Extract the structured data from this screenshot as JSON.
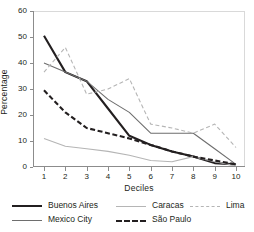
{
  "chart_data": {
    "type": "line",
    "title": "",
    "xlabel": "Deciles",
    "ylabel": "Percentage",
    "categories": [
      "1",
      "2",
      "3",
      "4",
      "5",
      "6",
      "7",
      "8",
      "9",
      "10"
    ],
    "x": [
      1,
      2,
      3,
      4,
      5,
      6,
      7,
      8,
      9,
      10
    ],
    "xlim": [
      1,
      10
    ],
    "ylim": [
      0,
      60
    ],
    "yticks": [
      0,
      10,
      20,
      30,
      40,
      50,
      60
    ],
    "grid": false,
    "legend_position": "bottom",
    "series": [
      {
        "name": "Buenos Aires",
        "color": "#231f20",
        "style": "solid",
        "width": "thick",
        "values": [
          50.5,
          36.5,
          33.0,
          22.5,
          12.0,
          8.5,
          6.0,
          4.0,
          1.5,
          1.0
        ]
      },
      {
        "name": "Mexico City",
        "color": "#6e6e6e",
        "style": "solid",
        "width": "thin",
        "values": [
          40.0,
          36.5,
          33.0,
          26.0,
          21.0,
          13.0,
          13.0,
          13.0,
          7.0,
          1.0
        ]
      },
      {
        "name": "Caracas",
        "color": "#b5b5b5",
        "style": "solid",
        "width": "thin",
        "values": [
          11.0,
          8.0,
          7.0,
          6.0,
          4.5,
          2.5,
          2.0,
          4.0,
          2.0,
          0.5
        ]
      },
      {
        "name": "São Paulo",
        "color": "#231f20",
        "style": "dashed",
        "width": "thick",
        "values": [
          29.5,
          21.0,
          15.0,
          13.0,
          11.0,
          8.5,
          6.0,
          4.0,
          2.5,
          1.0
        ]
      },
      {
        "name": "Lima",
        "color": "#b5b5b5",
        "style": "dashed",
        "width": "thin",
        "values": [
          36.5,
          46.0,
          28.0,
          30.0,
          34.0,
          16.5,
          15.0,
          13.0,
          16.5,
          7.5
        ]
      }
    ]
  },
  "axes": {
    "y_label": "Percentage",
    "x_label": "Deciles",
    "y_ticks": [
      "0",
      "10",
      "20",
      "30",
      "40",
      "50",
      "60"
    ],
    "x_ticks": [
      "1",
      "2",
      "3",
      "4",
      "5",
      "6",
      "7",
      "8",
      "9",
      "10"
    ]
  },
  "legend": {
    "entries": [
      {
        "label": "Buenos Aires"
      },
      {
        "label": "Mexico City"
      },
      {
        "label": "Caracas"
      },
      {
        "label": "São Paulo"
      },
      {
        "label": "Lima"
      }
    ]
  }
}
